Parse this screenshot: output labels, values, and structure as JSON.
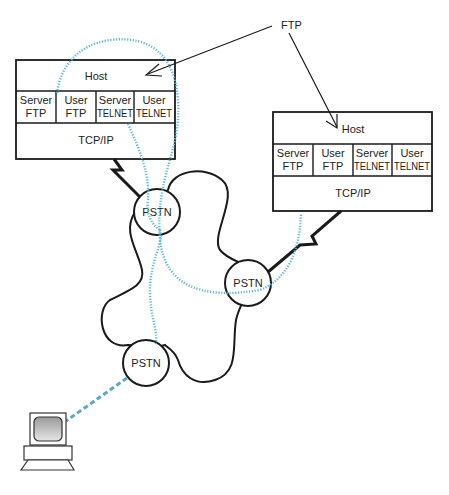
{
  "diagram": {
    "annotation": {
      "label": "FTP"
    },
    "host_left": {
      "title": "Host",
      "modules": [
        {
          "line1": "Server",
          "line2": "FTP"
        },
        {
          "line1": "User",
          "line2": "FTP"
        },
        {
          "line1": "Server",
          "line2": "TELNET"
        },
        {
          "line1": "User",
          "line2": "TELNET"
        }
      ],
      "transport": "TCP/IP"
    },
    "host_right": {
      "title": "Host",
      "modules": [
        {
          "line1": "Server",
          "line2": "FTP"
        },
        {
          "line1": "User",
          "line2": "FTP"
        },
        {
          "line1": "Server",
          "line2": "TELNET"
        },
        {
          "line1": "User",
          "line2": "TELNET"
        }
      ],
      "transport": "TCP/IP"
    },
    "network_nodes": [
      {
        "label": "PSTN"
      },
      {
        "label": "PSTN"
      },
      {
        "label": "PSTN"
      }
    ],
    "terminal": {
      "label": ""
    },
    "colors": {
      "line": "#1a1a1a",
      "dotted_path": "#5bb8d8",
      "dashed_link": "#5aa9c9"
    }
  }
}
